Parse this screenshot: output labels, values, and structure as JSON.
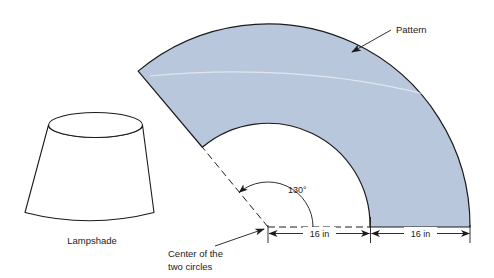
{
  "figure": {
    "background_color": "#ffffff",
    "stroke_color": "#1b1b1b"
  },
  "lampshade": {
    "label": "Lampshade",
    "shape_name": "truncated-cone-frustum",
    "fill_color": "#ffffff",
    "stroke_color": "#1b1b1b"
  },
  "pattern": {
    "label": "Pattern",
    "shape_name": "annular-sector",
    "fill_color": "#b9c7dd",
    "stroke_color": "#1b1b1b"
  },
  "angle": {
    "label": "130°",
    "value": 130,
    "unit": "degrees"
  },
  "center": {
    "label_line_1": "Center of the",
    "label_line_2": "two circles"
  },
  "dimensions": [
    {
      "label": "16 in",
      "value": 16,
      "unit": "in",
      "description": "inner-radius"
    },
    {
      "label": "16 in",
      "value": 16,
      "unit": "in",
      "description": "annulus-width"
    }
  ]
}
